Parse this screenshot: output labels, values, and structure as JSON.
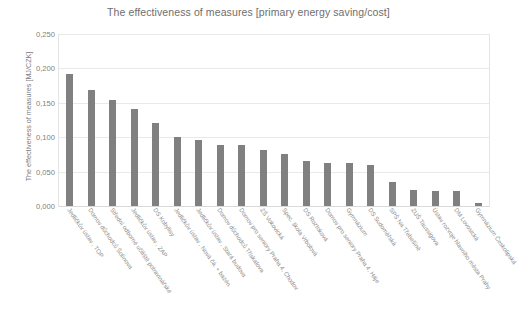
{
  "chart_data": {
    "type": "bar",
    "title": "The effectiveness of measures [primary energy saving/cost]",
    "xlabel": "",
    "ylabel": "The effectiveness of measures [MJ/CZK]",
    "ylim": [
      0,
      0.25
    ],
    "ytick_values": [
      0.0,
      0.05,
      0.1,
      0.15,
      0.2,
      0.25
    ],
    "ytick_labels": [
      "0,000",
      "0,050",
      "0,100",
      "0,150",
      "0,200",
      "0,250"
    ],
    "grid": "horizontal",
    "legend": "none",
    "decimal_separator": ",",
    "bar_color": "#808080",
    "categories": [
      "Jedličkův ústav , TOP",
      "Domov důchodců Šolínova",
      "Střední odborné učiliště potravinářské",
      "Jedličkův ústav , ZAP",
      "DS Kobylisy",
      "Jedličkův ústav , Nová čá. + bazén",
      "Jedličkův ústav , Stará budova",
      "Domov důchodců Třískalova",
      "Domov pro seniory Praha 4, Chodov",
      "ZŠ Vokovická",
      "Spec. škola Vrbolová",
      "DS Roztoková",
      "Domov pro seniory Praha 4, Háje",
      "Gymnázium",
      "DS Sudoměřská",
      "SPŠ Na Třebešíně",
      "ZUŠ Taussigova",
      "Ústav rozvoje hlavního města Prahy",
      "DM Lovosická",
      "Gymnázium Českolipská"
    ],
    "values": [
      0.192,
      0.168,
      0.154,
      0.141,
      0.121,
      0.1,
      0.096,
      0.089,
      0.088,
      0.081,
      0.076,
      0.065,
      0.063,
      0.062,
      0.06,
      0.035,
      0.024,
      0.022,
      0.022,
      0.005
    ]
  }
}
